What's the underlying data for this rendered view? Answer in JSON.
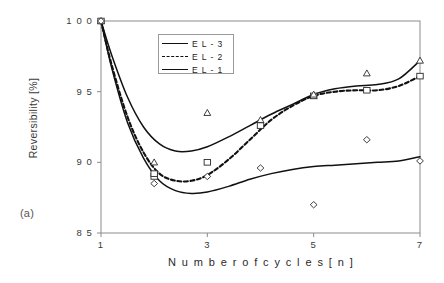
{
  "figure": {
    "panel_label": "(a)",
    "background": "#ffffff",
    "frame_color": "#8c8c8c",
    "curve_color": "#111111"
  },
  "chart_data": {
    "type": "line",
    "title": "",
    "subtitle": "",
    "xlabel": "N u m b e r  o f  c y c l e s    [ n ]",
    "ylabel": "Reversibility [%]",
    "xlim": [
      1,
      7
    ],
    "ylim": [
      85,
      100
    ],
    "xticks": [
      1,
      3,
      5,
      7
    ],
    "xtick_labels": [
      "1",
      "3",
      "5",
      "7"
    ],
    "yticks": [
      85,
      90,
      95,
      100
    ],
    "ytick_labels": [
      "8 5",
      "9 0",
      "9 5",
      "1 0 0"
    ],
    "grid": false,
    "legend_position": "upper-center-left",
    "legend_entries": [
      "E L - 3",
      "E L - 2",
      "E L - 1"
    ],
    "series": [
      {
        "name": "E L - 3",
        "linestyle": "solid",
        "marker": "triangle",
        "x": [
          1,
          2,
          3,
          4,
          5,
          6,
          7
        ],
        "values": [
          100.0,
          90.0,
          93.5,
          93.0,
          94.7,
          96.3,
          97.2
        ],
        "fit_x": [
          1.0,
          1.2,
          1.5,
          1.8,
          2.1,
          2.4,
          2.7,
          3.0,
          3.4,
          3.8,
          4.2,
          4.6,
          5.0,
          5.4,
          5.8,
          6.2,
          6.6,
          7.0
        ],
        "fit_y": [
          100.0,
          97.6,
          94.6,
          92.5,
          91.3,
          90.8,
          90.8,
          91.1,
          91.8,
          92.6,
          93.4,
          94.1,
          94.8,
          95.2,
          95.4,
          95.5,
          95.9,
          97.2
        ]
      },
      {
        "name": "E L - 2",
        "linestyle": "dashed",
        "marker": "square",
        "x": [
          1,
          2,
          3,
          4,
          5,
          6,
          7
        ],
        "values": [
          100.0,
          89.0,
          90.0,
          92.6,
          94.7,
          95.1,
          96.1
        ],
        "fit_x": [
          1.0,
          1.2,
          1.5,
          1.8,
          2.1,
          2.4,
          2.7,
          3.0,
          3.4,
          3.8,
          4.2,
          4.6,
          5.0,
          5.4,
          5.8,
          6.2,
          6.6,
          7.0
        ],
        "fit_y": [
          100.0,
          96.9,
          93.2,
          90.7,
          89.2,
          88.7,
          88.7,
          89.1,
          90.2,
          91.6,
          93.0,
          94.0,
          94.7,
          95.0,
          95.1,
          95.1,
          95.4,
          96.1
        ]
      },
      {
        "name": "E L - 1",
        "linestyle": "solid",
        "marker": "diamond",
        "x": [
          1,
          2,
          3,
          4,
          5,
          6,
          7
        ],
        "values": [
          100.0,
          88.5,
          89.0,
          89.6,
          87.0,
          91.6,
          90.1
        ],
        "fit_x": [
          1.0,
          1.2,
          1.5,
          1.8,
          2.1,
          2.4,
          2.7,
          3.0,
          3.4,
          3.8,
          4.2,
          4.6,
          5.0,
          5.4,
          5.8,
          6.2,
          6.6,
          7.0
        ],
        "fit_y": [
          100.0,
          96.7,
          92.8,
          90.3,
          88.7,
          88.0,
          87.8,
          87.9,
          88.3,
          88.8,
          89.2,
          89.5,
          89.7,
          89.8,
          89.9,
          90.0,
          90.1,
          90.4
        ]
      }
    ],
    "extra_points": [
      {
        "series": "E L - 2",
        "marker": "square",
        "x": 2,
        "y": 89.2
      },
      {
        "series": "E L - 3",
        "marker": "triangle",
        "x": 5,
        "y": 94.8
      }
    ]
  }
}
